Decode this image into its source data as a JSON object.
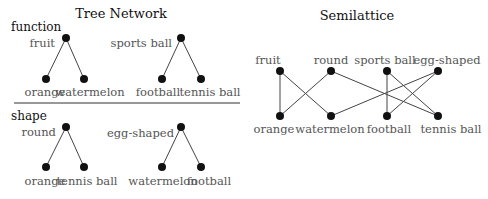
{
  "colors": {
    "node": "#111111",
    "edge": "#444444",
    "label": "#555555",
    "title": "#111111",
    "divider": "#333333"
  },
  "tree_network": {
    "title": "Tree Network",
    "sections": [
      {
        "name": "function",
        "trees": [
          {
            "root": "fruit",
            "children": [
              "orange",
              "watermelon"
            ]
          },
          {
            "root": "sports ball",
            "children": [
              "football",
              "tennis ball"
            ]
          }
        ]
      },
      {
        "name": "shape",
        "trees": [
          {
            "root": "round",
            "children": [
              "orange",
              "tennis ball"
            ]
          },
          {
            "root": "egg-shaped",
            "children": [
              "watermelon",
              "football"
            ]
          }
        ]
      }
    ]
  },
  "semilattice": {
    "title": "Semilattice",
    "top": [
      "fruit",
      "round",
      "sports ball",
      "egg-shaped"
    ],
    "bottom": [
      "orange",
      "watermelon",
      "football",
      "tennis ball"
    ],
    "edges": [
      [
        "fruit",
        "orange"
      ],
      [
        "fruit",
        "watermelon"
      ],
      [
        "round",
        "orange"
      ],
      [
        "round",
        "tennis ball"
      ],
      [
        "sports ball",
        "football"
      ],
      [
        "sports ball",
        "tennis ball"
      ],
      [
        "egg-shaped",
        "watermelon"
      ],
      [
        "egg-shaped",
        "football"
      ]
    ]
  }
}
